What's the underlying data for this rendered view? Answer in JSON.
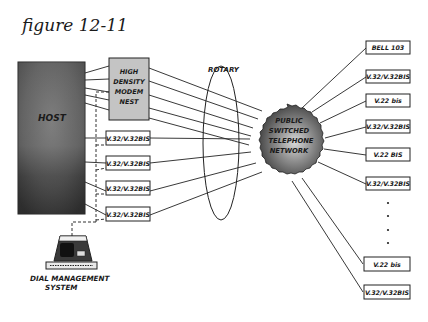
{
  "figure": {
    "title": "figure 12-11"
  },
  "host": {
    "label": "HOST"
  },
  "modem_nest": {
    "lines": [
      "HIGH",
      "DENSITY",
      "MODEM",
      "NEST"
    ]
  },
  "left_modems": [
    {
      "label": "V.32/V.32BIS"
    },
    {
      "label": "V.32/V.32BIS"
    },
    {
      "label": "V.32/V.32BIS"
    },
    {
      "label": "V.32/V.32BIS"
    }
  ],
  "rotary": {
    "label": "ROTARY"
  },
  "network": {
    "lines": [
      "PUBLIC",
      "SWITCHED",
      "TELEPHONE",
      "NETWORK"
    ]
  },
  "right_modems": [
    {
      "label": "BELL 103"
    },
    {
      "label": "V.32/V.32BIS"
    },
    {
      "label": "V.22 bis"
    },
    {
      "label": "V.32/V.32BIS"
    },
    {
      "label": "V.22 BIS"
    },
    {
      "label": "V.32/V.32BIS"
    },
    {
      "label": "V.22 bis"
    },
    {
      "label": "V.32/V.32BIS"
    }
  ],
  "dial_management": {
    "lines": [
      "DIAL MANAGEMENT",
      "SYSTEM"
    ]
  },
  "colors": {
    "ink": "#1a1a1a",
    "host_fill": "#5a5a5a",
    "nest_fill": "#c8c8c8",
    "cloud_fill": "#7a7a7a"
  }
}
